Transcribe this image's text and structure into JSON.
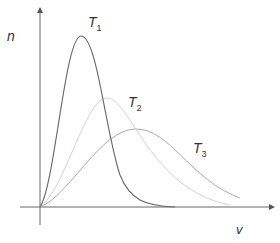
{
  "labels": {
    "y_axis": "n",
    "x_axis": "v",
    "curves": [
      {
        "name": "T",
        "sub": "1"
      },
      {
        "name": "T",
        "sub": "2"
      },
      {
        "name": "T",
        "sub": "3"
      }
    ]
  },
  "colors": {
    "axis": "#555555",
    "t1": "#666666",
    "t2": "#d0d0d0",
    "t3": "#aaaaaa"
  }
}
